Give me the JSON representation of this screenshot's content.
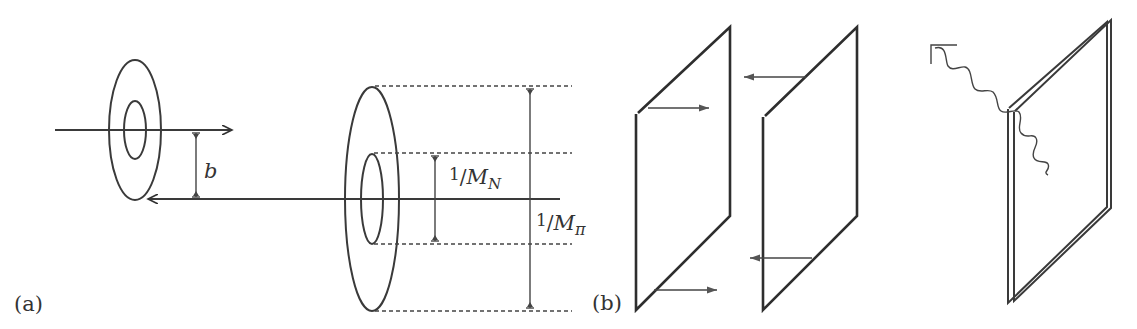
{
  "figure": {
    "panel_a": {
      "label": "(a)",
      "impact_parameter_label": "b",
      "inner_radius_label_num": "1",
      "inner_radius_label_den": "M",
      "inner_radius_label_sub": "N",
      "outer_radius_label_num": "1",
      "outer_radius_label_den": "M",
      "outer_radius_label_sub": "π"
    },
    "panel_b": {
      "label": "(b)"
    }
  }
}
